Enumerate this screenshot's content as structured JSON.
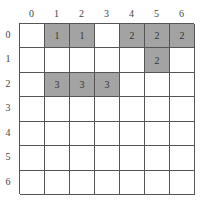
{
  "grid": {
    "rows": 7,
    "cols": 7,
    "col_labels": [
      "0",
      "1",
      "2",
      "3",
      "4",
      "5",
      "6"
    ],
    "row_labels": [
      "0",
      "1",
      "2",
      "3",
      "4",
      "5",
      "6"
    ],
    "fill_color": "#a3a3a3",
    "cells": [
      [
        "",
        "1",
        "1",
        "",
        "2",
        "2",
        "2"
      ],
      [
        "",
        "",
        "",
        "",
        "",
        "2",
        ""
      ],
      [
        "",
        "3",
        "3",
        "3",
        "",
        "",
        ""
      ],
      [
        "",
        "",
        "",
        "",
        "",
        "",
        ""
      ],
      [
        "",
        "",
        "",
        "",
        "",
        "",
        ""
      ],
      [
        "",
        "",
        "",
        "",
        "",
        "",
        ""
      ],
      [
        "",
        "",
        "",
        "",
        "",
        "",
        ""
      ]
    ]
  }
}
